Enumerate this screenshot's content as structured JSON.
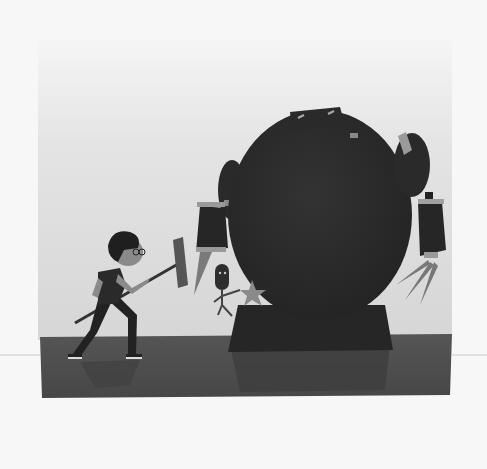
{
  "image": {
    "description": "Grayscale illustration of a boy with glasses swinging a sledgehammer at a giant round dark robot; a small robot with a star burst stands near the big robot's feet, on a dark reflective floor.",
    "colors": {
      "page_background": "#f7f7f7",
      "wall": "#d9d9d9",
      "wall_top": "#efefef",
      "floor": "#4a4a4a",
      "robot_body": "#2a2a2a",
      "robot_highlight": "#9a9a9a",
      "boy_dark": "#262626",
      "skin": "#8a8a8a"
    },
    "elements": {
      "boy": "boy-with-hammer",
      "robot": "giant-robot",
      "small_robot": "small-robot",
      "star": "impact-star"
    }
  }
}
